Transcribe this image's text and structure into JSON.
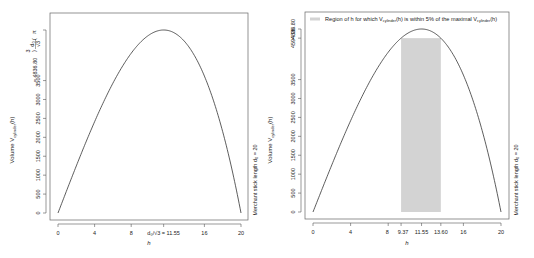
{
  "chart_data": [
    {
      "type": "line",
      "title": "",
      "xlabel": "h",
      "ylabel": "Volume V_cylinder(h)",
      "right_label": "Merchant stick length d_0 = 20",
      "xlim": [
        0,
        20
      ],
      "ylim": [
        0,
        4836.8
      ],
      "x_ticks": [
        0,
        4,
        8,
        11.55,
        16,
        20
      ],
      "x_tick_labels": [
        "0",
        "4",
        "8",
        "d₀/√3 = 11.55",
        "16",
        "20"
      ],
      "y_ticks": [
        0,
        500,
        1000,
        1500,
        2000,
        2500,
        3000,
        3500,
        4836.8
      ],
      "y_tick_labels": [
        "0",
        "500",
        "1000",
        "1500",
        "2000",
        "2500",
        "3000",
        "3500",
        "π(d₀/√3)³ = 4836.80"
      ],
      "function": "V(h) = π·h·(d₀² − h²)/2, d₀ = 20",
      "series": [
        {
          "name": "V_cylinder(h)",
          "x": [
            0,
            2,
            4,
            6,
            8,
            10,
            11.55,
            12,
            14,
            16,
            18,
            20
          ],
          "values": [
            0,
            1244.1,
            2412.7,
            3430.4,
            4222.3,
            4712.4,
            4836.8,
            4825.5,
            4485.5,
            3619.1,
            2148.8,
            0
          ]
        }
      ],
      "grid": false
    },
    {
      "type": "line",
      "title": "",
      "xlabel": "h",
      "ylabel": "Volume V_cylinder(h)",
      "right_label": "Merchant stick length d_0 = 20",
      "xlim": [
        0,
        20
      ],
      "ylim": [
        0,
        4836.8
      ],
      "x_ticks": [
        0,
        4,
        8,
        9.37,
        11.55,
        13.6,
        16,
        20
      ],
      "x_tick_labels": [
        "0",
        "4",
        "8",
        "9.37",
        "11.55",
        "13.60",
        "16",
        "20"
      ],
      "y_ticks": [
        0,
        500,
        1000,
        1500,
        2000,
        2500,
        3000,
        3500,
        4594.96,
        4836.8
      ],
      "y_tick_labels": [
        "0",
        "500",
        "1000",
        "1500",
        "2000",
        "2500",
        "3000",
        "3500",
        "4594.96",
        "4836.80"
      ],
      "legend": [
        "Region of h for which V_cylinder(h) is within 5% of the maximal V_cylinder(h)"
      ],
      "legend_position": "top",
      "shaded_region": {
        "x_start": 9.37,
        "x_end": 13.6,
        "color": "#d3d3d3"
      },
      "series": [
        {
          "name": "V_cylinder(h)",
          "x": [
            0,
            2,
            4,
            6,
            8,
            10,
            11.55,
            12,
            14,
            16,
            18,
            20
          ],
          "values": [
            0,
            1244.1,
            2412.7,
            3430.4,
            4222.3,
            4712.4,
            4836.8,
            4825.5,
            4485.5,
            3619.1,
            2148.8,
            0
          ]
        }
      ],
      "grid": false
    }
  ],
  "left_plot": {
    "ylabel_main": "Volume V",
    "ylabel_sub": "cylinder",
    "ylabel_tail": "(h)",
    "xlabel": "h",
    "right_main": "Merchant stick length d",
    "right_sub": "0",
    "right_tail": " = 20",
    "y_ticks": [
      "0",
      "500",
      "1000",
      "1500",
      "2000",
      "2500",
      "3000",
      "3500"
    ],
    "y_max_label": "= 4836.80",
    "x_ticks": [
      "0",
      "4",
      "8",
      "16",
      "20"
    ],
    "x_special": "d₀/√3 = 11.55"
  },
  "right_plot": {
    "ylabel_main": "Volume V",
    "ylabel_sub": "cylinder",
    "ylabel_tail": "(h)",
    "xlabel": "h",
    "right_main": "Merchant stick length d",
    "right_sub": "0",
    "right_tail": " = 20",
    "y_ticks": [
      "0",
      "500",
      "1000",
      "1500",
      "2000",
      "2500",
      "3000",
      "3500"
    ],
    "y_95_label": "4594.96",
    "y_max_label": "4836.80",
    "x_ticks": [
      "0",
      "4",
      "8",
      "9.37",
      "11.55",
      "13.60",
      "16",
      "20"
    ],
    "legend_a": "Region of h for which V",
    "legend_sub1": "cylinder",
    "legend_b": "(h) is within 5% of the maximal V",
    "legend_sub2": "cylinder",
    "legend_c": "(h)"
  },
  "colors": {
    "curve": "#333333",
    "shade": "#d3d3d3",
    "axis": "#555555"
  }
}
